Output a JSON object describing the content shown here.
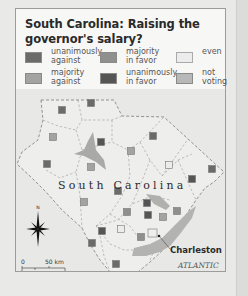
{
  "title": "South Carolina: Raising the governor's salary?",
  "legend": [
    {
      "key": "unanimously-against",
      "label": "unanimously\nagainst",
      "color": "#6b6b6b"
    },
    {
      "key": "majority-in-favor",
      "label": "majority\nin favor",
      "color": "#8f8f8f"
    },
    {
      "key": "even",
      "label": "even",
      "color": "#ececec"
    },
    {
      "key": "majority-against",
      "label": "majority\nagainst",
      "color": "#a3a3a3"
    },
    {
      "key": "unanimously-in-favor",
      "label": "unanimously\nin favor",
      "color": "#555555"
    },
    {
      "key": "not-voting",
      "label": "not\nvoting",
      "color": "#b8b8b8"
    }
  ],
  "map": {
    "state_label": "South Carolina",
    "city_label": "Charleston",
    "ocean_label_1": "ATLANTIC",
    "ocean_label_2": "OCEAN",
    "compass_label": "N",
    "scale": {
      "km_zero": "0",
      "km_label": "50 km",
      "mi_zero": "0",
      "mi_label": "50 miles"
    },
    "squares": [
      {
        "x": 62,
        "y": 110,
        "vote": "unanimously-against"
      },
      {
        "x": 91,
        "y": 103,
        "vote": "unanimously-against"
      },
      {
        "x": 53,
        "y": 137,
        "vote": "majority-against"
      },
      {
        "x": 101,
        "y": 142,
        "vote": "unanimously-in-favor"
      },
      {
        "x": 153,
        "y": 136,
        "vote": "unanimously-against"
      },
      {
        "x": 131,
        "y": 151,
        "vote": "majority-against"
      },
      {
        "x": 47,
        "y": 164,
        "vote": "unanimously-against"
      },
      {
        "x": 91,
        "y": 167,
        "vote": "majority-against"
      },
      {
        "x": 169,
        "y": 165,
        "vote": "even"
      },
      {
        "x": 212,
        "y": 169,
        "vote": "unanimously-against"
      },
      {
        "x": 192,
        "y": 179,
        "vote": "unanimously-in-favor"
      },
      {
        "x": 118,
        "y": 191,
        "vote": "unanimously-against"
      },
      {
        "x": 84,
        "y": 202,
        "vote": "majority-against"
      },
      {
        "x": 147,
        "y": 203,
        "vote": "unanimously-in-favor"
      },
      {
        "x": 127,
        "y": 212,
        "vote": "majority-in-favor"
      },
      {
        "x": 148,
        "y": 215,
        "vote": "unanimously-in-favor"
      },
      {
        "x": 163,
        "y": 217,
        "vote": "majority-against"
      },
      {
        "x": 177,
        "y": 211,
        "vote": "majority-in-favor"
      },
      {
        "x": 102,
        "y": 231,
        "vote": "unanimously-in-favor"
      },
      {
        "x": 121,
        "y": 229,
        "vote": "even"
      },
      {
        "x": 141,
        "y": 237,
        "vote": "majority-in-favor"
      },
      {
        "x": 92,
        "y": 243,
        "vote": "unanimously-against"
      },
      {
        "x": 116,
        "y": 264,
        "vote": "unanimously-against"
      }
    ]
  }
}
